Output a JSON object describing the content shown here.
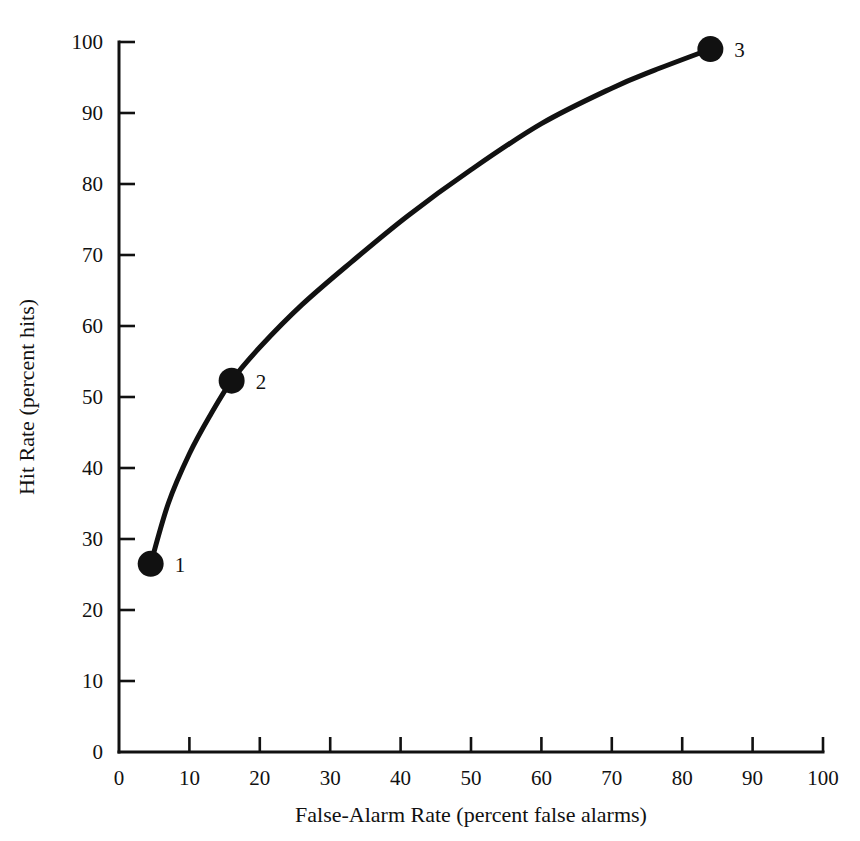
{
  "chart_data": {
    "type": "line",
    "title": "",
    "xlabel": "False-Alarm Rate (percent false alarms)",
    "ylabel": "Hit Rate (percent hits)",
    "xlim": [
      0,
      100
    ],
    "ylim": [
      0,
      100
    ],
    "xticks": [
      0,
      10,
      20,
      30,
      40,
      50,
      60,
      70,
      80,
      90,
      100
    ],
    "yticks": [
      0,
      10,
      20,
      30,
      40,
      50,
      60,
      70,
      80,
      90,
      100
    ],
    "xtick_labels": [
      "0",
      "10",
      "20",
      "30",
      "40",
      "50",
      "60",
      "70",
      "80",
      "90",
      "100"
    ],
    "ytick_labels": [
      "0",
      "10",
      "20",
      "30",
      "40",
      "50",
      "60",
      "70",
      "80",
      "90",
      "100"
    ],
    "grid": false,
    "legend": "none",
    "series": [
      {
        "name": "ROC curve",
        "color": "#111111",
        "x": [
          4.5,
          7,
          10,
          13,
          16,
          20,
          26,
          33,
          41,
          50,
          60,
          70,
          76,
          84
        ],
        "y": [
          26.5,
          35,
          42,
          47.5,
          52.3,
          57,
          63,
          69,
          75.5,
          82,
          88.5,
          93.5,
          96,
          99
        ]
      }
    ],
    "points": [
      {
        "label": "1",
        "x": 4.5,
        "y": 26.5
      },
      {
        "label": "2",
        "x": 16,
        "y": 52.3
      },
      {
        "label": "3",
        "x": 84,
        "y": 99
      }
    ],
    "point_labels": [
      "1",
      "2",
      "3"
    ]
  },
  "figure": {
    "background": "#ffffff",
    "ink_color": "#111111"
  }
}
